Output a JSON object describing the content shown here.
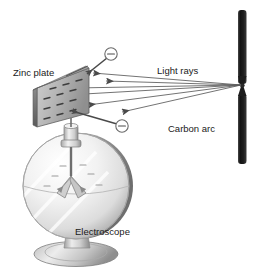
{
  "figure": {
    "background_color": "#ffffff",
    "width": 260,
    "height": 279
  },
  "labels": {
    "zinc_plate": "Zinc plate",
    "light_rays": "Light rays",
    "carbon_arc": "Carbon arc",
    "electroscope": "Electroscope"
  },
  "components": {
    "zinc_plate": {
      "name": "Zinc plate",
      "charge_marks": "−",
      "charge_mark_count": 12,
      "fill_color": "#b8b8b8",
      "edge_color": "#4a4a4a"
    },
    "carbon_arc": {
      "name": "Carbon arc",
      "rod_color": "#1c1c1c",
      "gap_y": 85,
      "x": 242,
      "top_rod_span": [
        10,
        84
      ],
      "bottom_rod_span": [
        88,
        164
      ]
    },
    "light_rays": {
      "name": "Light rays",
      "count": 6,
      "direction": "from carbon arc toward zinc plate",
      "arrow_color": "#4a4a4a",
      "origin": [
        242,
        85
      ]
    },
    "electrons": {
      "symbol": "−",
      "count": 2,
      "description": "ejected electrons shown as circled minus signs",
      "positions": [
        [
          111,
          55
        ],
        [
          122,
          126
        ]
      ],
      "color": "#4a4a4a"
    },
    "electroscope": {
      "name": "Electroscope",
      "globe_fill": "#eeeeee",
      "globe_edge": "#8d8d8d",
      "leaf_charge_marks": "−",
      "leaf_charge_mark_count": 6,
      "base_fill": "#d0d0d0"
    }
  },
  "colors": {
    "ink": "#1a1a1a",
    "dark_rod": "#1c1c1c",
    "mid_gray": "#9a9a9a",
    "light_gray": "#e4e4e4",
    "arrow": "#4a4a4a"
  }
}
